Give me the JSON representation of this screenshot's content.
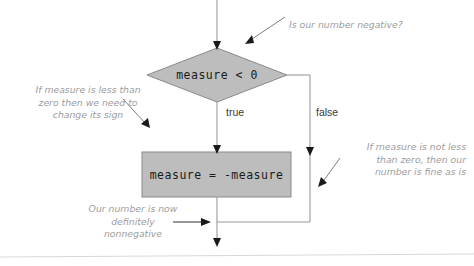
{
  "diagram": {
    "type": "flowchart",
    "nodes": {
      "decision": {
        "shape": "diamond",
        "text": "measure < 0",
        "fill": "#bdbdbd",
        "stroke": "#8a8a8a"
      },
      "process": {
        "shape": "rectangle",
        "text": "measure = -measure",
        "fill": "#bdbdbd",
        "stroke": "#8a8a8a"
      }
    },
    "branches": {
      "true_label": "true",
      "false_label": "false"
    },
    "annotations": {
      "negative": "Is our number negative?",
      "less_than": "If measure is less than\nzero then we need to\nchange its sign",
      "not_less": "If measure is not less\nthan zero, then our\nnumber is fine as is",
      "nonnegative": "Our number is now\ndefinitely\nnonnegative"
    },
    "colors": {
      "shape_fill": "#bdbdbd",
      "shape_stroke": "#8a8a8a",
      "flow_line": "#9a9a9a",
      "arrow_head": "#1a1a1a",
      "note_text": "#9d9d9d",
      "label_text": "#3a3a3a",
      "code_text": "#1b1b1b",
      "footer_rule": "#d8d8d8",
      "background": "#ffffff"
    }
  }
}
